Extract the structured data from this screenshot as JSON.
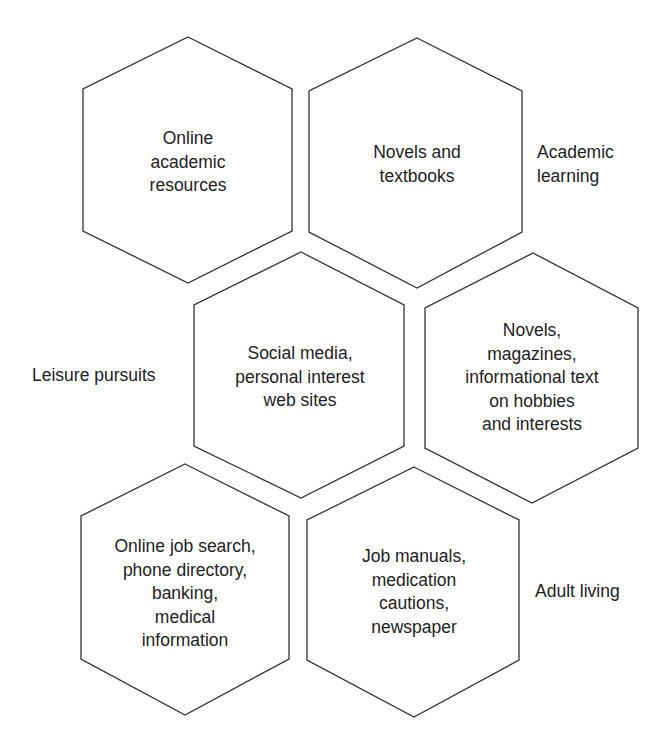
{
  "rows": [
    {
      "label": [
        "Academic",
        "learning"
      ],
      "label_side": "right",
      "cells": [
        {
          "lines": [
            "Online",
            "academic",
            "resources"
          ],
          "type": "digital"
        },
        {
          "lines": [
            "Novels and",
            "textbooks"
          ],
          "type": "print"
        }
      ]
    },
    {
      "label": [
        "Leisure pursuits"
      ],
      "label_side": "left",
      "cells": [
        {
          "lines": [
            "Social media,",
            "personal interest",
            "web sites"
          ],
          "type": "digital"
        },
        {
          "lines": [
            "Novels,",
            "magazines,",
            "informational text",
            "on hobbies",
            "and interests"
          ],
          "type": "print"
        }
      ]
    },
    {
      "label": [
        "Adult living"
      ],
      "label_side": "right",
      "cells": [
        {
          "lines": [
            "Online job search,",
            "phone directory,",
            "banking,",
            "medical",
            "information"
          ],
          "type": "digital"
        },
        {
          "lines": [
            "Job manuals,",
            "medication",
            "cautions,",
            "newspaper"
          ],
          "type": "print"
        }
      ]
    }
  ],
  "colors": {
    "stroke": "#333333",
    "text": "#222222",
    "background": "#ffffff"
  }
}
